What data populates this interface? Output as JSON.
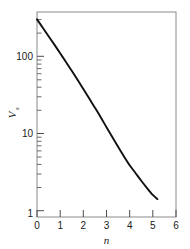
{
  "chart_data": {
    "type": "line",
    "title": "",
    "xlabel": "n",
    "ylabel": "V",
    "ylabel_subscript": "s",
    "yscale": "log",
    "xscale": "linear",
    "xlim": [
      0,
      6
    ],
    "ylim": [
      1,
      500
    ],
    "grid": false,
    "legend": null,
    "xticks": [
      0,
      1,
      2,
      3,
      4,
      5,
      6
    ],
    "xticklabels": [
      "0",
      "1",
      "2",
      "3",
      "4",
      "5",
      "6"
    ],
    "yticks": [
      1,
      10,
      100
    ],
    "yticklabels": [
      "1",
      "10",
      "100"
    ],
    "y_minor_ticks": [
      2,
      3,
      4,
      5,
      6,
      7,
      8,
      9,
      20,
      30,
      40,
      50,
      60,
      70,
      80,
      90,
      200,
      300,
      400
    ],
    "series": [
      {
        "name": "Vs vs n",
        "x": [
          0.0,
          0.25,
          0.5,
          0.75,
          1.0,
          1.25,
          1.5,
          1.75,
          2.0,
          2.25,
          2.5,
          2.75,
          3.0,
          3.25,
          3.5,
          3.75,
          4.0,
          4.25,
          4.5,
          4.75,
          5.0,
          5.2
        ],
        "y": [
          400,
          310,
          240,
          186,
          143,
          110,
          84,
          64,
          48.5,
          36.5,
          27.5,
          20.6,
          15.2,
          11.3,
          8.4,
          6.3,
          4.8,
          3.8,
          3.0,
          2.4,
          1.95,
          1.72
        ]
      }
    ],
    "line_color": "#111111",
    "axis_color": "#8a8a8a",
    "background": "#ffffff"
  },
  "axes": {
    "x_axis_name": "n-axis",
    "y_axis_name": "Vs-axis"
  }
}
